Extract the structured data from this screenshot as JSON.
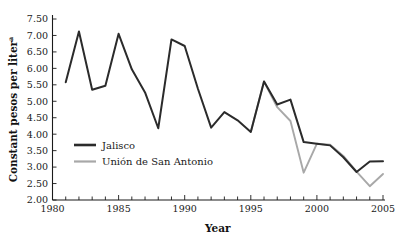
{
  "chart_data": {
    "type": "line",
    "title": "",
    "xlabel": "Year",
    "ylabel": "Constant pesos per liter",
    "ylabel_superscript": "a",
    "xlim": [
      1980,
      2005
    ],
    "ylim": [
      2.0,
      7.5
    ],
    "grid": false,
    "legend_position": "inner-left",
    "x": [
      1981,
      1982,
      1983,
      1984,
      1985,
      1986,
      1987,
      1988,
      1989,
      1990,
      1991,
      1992,
      1993,
      1994,
      1995,
      1996,
      1997,
      1998,
      1999,
      2000,
      2001,
      2002,
      2003,
      2004,
      2005
    ],
    "xtick_labels": [
      "1980",
      "1985",
      "1990",
      "1995",
      "2000",
      "2005"
    ],
    "xtick_values": [
      1980,
      1985,
      1990,
      1995,
      2000,
      2005
    ],
    "xtick_minor_step": 1,
    "ytick_labels": [
      "2.00",
      "2.50",
      "3.00",
      "3.50",
      "4.00",
      "4.50",
      "5.00",
      "5.50",
      "6.00",
      "6.50",
      "7.00",
      "7.50"
    ],
    "ytick_values": [
      2.0,
      2.5,
      3.0,
      3.5,
      4.0,
      4.5,
      5.0,
      5.5,
      6.0,
      6.5,
      7.0,
      7.5
    ],
    "series": [
      {
        "name": "Jalisco",
        "color": "#2b2b2b",
        "x": [
          1981,
          1982,
          1983,
          1984,
          1985,
          1986,
          1987,
          1988,
          1989,
          1990,
          1991,
          1992,
          1993,
          1994,
          1995,
          1996,
          1997,
          1998,
          1999,
          2000,
          2001,
          2002,
          2003,
          2004,
          2005
        ],
        "values": [
          5.58,
          7.12,
          5.35,
          5.47,
          7.05,
          5.97,
          5.27,
          4.18,
          6.88,
          6.68,
          5.38,
          4.2,
          4.67,
          4.42,
          4.07,
          5.6,
          4.9,
          5.05,
          3.76,
          3.71,
          3.66,
          3.3,
          2.85,
          3.17,
          3.18
        ]
      },
      {
        "name": "Unión de San Antonio",
        "color": "#a8a8a8",
        "x": [
          1995,
          1996,
          1997,
          1998,
          1999,
          2000,
          2001,
          2002,
          2003,
          2004,
          2005
        ],
        "values": [
          4.07,
          5.6,
          4.82,
          4.4,
          2.83,
          3.71,
          3.68,
          3.34,
          2.86,
          2.42,
          2.79
        ]
      }
    ],
    "legend": [
      {
        "label": "Jalisco",
        "color": "#2b2b2b"
      },
      {
        "label": "Unión de San Antonio",
        "color": "#a8a8a8"
      }
    ]
  }
}
